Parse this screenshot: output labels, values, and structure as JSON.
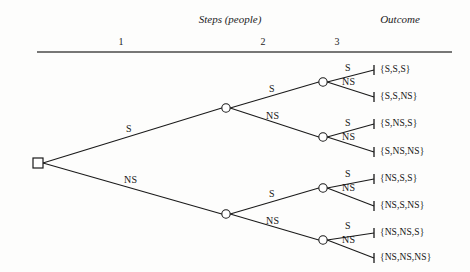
{
  "headers": {
    "steps": "Steps  (people)",
    "outcome": "Outcome"
  },
  "columns": [
    {
      "label": "1",
      "x": 121
    },
    {
      "label": "2",
      "x": 263
    },
    {
      "label": "3",
      "x": 337
    }
  ],
  "rule": {
    "x1": 37,
    "x2": 452,
    "y": 52,
    "color": "#4a4a4a"
  },
  "nodes": {
    "root": {
      "shape": "square",
      "x": 38,
      "y": 163
    },
    "level1": [
      {
        "id": "n-S",
        "x": 226,
        "y": 108
      },
      {
        "id": "n-NS",
        "x": 226,
        "y": 214
      }
    ],
    "level2": [
      {
        "id": "n-S-S",
        "x": 323,
        "y": 82
      },
      {
        "id": "n-S-NS",
        "x": 323,
        "y": 137
      },
      {
        "id": "n-NS-S",
        "x": 323,
        "y": 188
      },
      {
        "id": "n-NS-NS",
        "x": 323,
        "y": 240
      }
    ],
    "terminal_x": 374
  },
  "branch_labels": {
    "level1": [
      {
        "text": "S",
        "x": 126,
        "y": 123
      },
      {
        "text": "NS",
        "x": 124,
        "y": 174
      }
    ],
    "level2": [
      {
        "text": "S",
        "x": 269,
        "y": 83
      },
      {
        "text": "NS",
        "x": 266,
        "y": 110
      },
      {
        "text": "S",
        "x": 269,
        "y": 188
      },
      {
        "text": "NS",
        "x": 266,
        "y": 215
      }
    ],
    "level3": [
      {
        "text": "S",
        "x": 345,
        "y": 62
      },
      {
        "text": "NS",
        "x": 342,
        "y": 76
      },
      {
        "text": "S",
        "x": 345,
        "y": 117
      },
      {
        "text": "NS",
        "x": 342,
        "y": 131
      },
      {
        "text": "S",
        "x": 345,
        "y": 168
      },
      {
        "text": "NS",
        "x": 342,
        "y": 182
      },
      {
        "text": "S",
        "x": 345,
        "y": 220
      },
      {
        "text": "NS",
        "x": 342,
        "y": 234
      }
    ]
  },
  "outcomes": [
    {
      "text": "{S,S,S}",
      "y": 64,
      "tick_y": 70
    },
    {
      "text": "{S,S,NS}",
      "y": 91,
      "tick_y": 97
    },
    {
      "text": "{S,NS,S}",
      "y": 118,
      "tick_y": 124
    },
    {
      "text": "{S,NS,NS}",
      "y": 146,
      "tick_y": 152
    },
    {
      "text": "{NS,S,S}",
      "y": 173,
      "tick_y": 179
    },
    {
      "text": "{NS,S,NS}",
      "y": 200,
      "tick_y": 206
    },
    {
      "text": "{NS,NS,S}",
      "y": 227,
      "tick_y": 233
    },
    {
      "text": "{NS,NS,NS}",
      "y": 252,
      "tick_y": 258
    }
  ],
  "style": {
    "line_color": "#1a1a1a",
    "node_fill": "#ffffff",
    "node_stroke": "#1a1a1a"
  }
}
